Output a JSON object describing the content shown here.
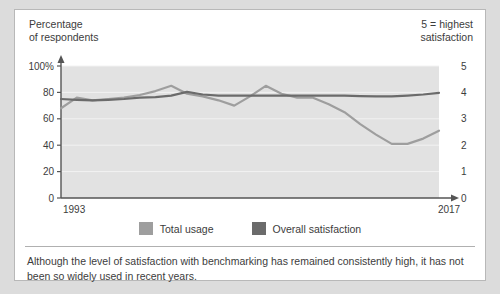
{
  "header": {
    "left_label": "Percentage\nof respondents",
    "right_label": "5 = highest\nsatisfaction"
  },
  "legend": {
    "items": [
      {
        "label": "Total usage",
        "color": "#9e9e9e"
      },
      {
        "label": "Overall satisfaction",
        "color": "#6b6b6b"
      }
    ]
  },
  "caption": {
    "text": "Although the level of satisfaction with benchmarking has remained consistently high, it has not been so widely used in recent years."
  },
  "chart_data": {
    "type": "line",
    "title": "",
    "subtitle": "",
    "xlabel": "",
    "ylabel": "Percentage of respondents",
    "y2label": "5 = highest satisfaction",
    "grid": true,
    "legend_position": "bottom",
    "plot_background": "#e2e2e2",
    "x": [
      1993,
      1994,
      1995,
      1996,
      1997,
      1998,
      1999,
      2000,
      2001,
      2002,
      2003,
      2004,
      2005,
      2006,
      2007,
      2008,
      2009,
      2010,
      2011,
      2012,
      2013,
      2014,
      2015,
      2016,
      2017
    ],
    "xlim": [
      1993,
      2017
    ],
    "x_tick_labels": [
      "1993",
      "2017"
    ],
    "ylim": [
      0,
      100
    ],
    "y_tick_labels": [
      "0",
      "20",
      "40",
      "60",
      "80",
      "100%"
    ],
    "y_ticks": [
      0,
      20,
      40,
      60,
      80,
      100
    ],
    "y2lim": [
      0,
      5
    ],
    "y2_tick_labels": [
      "0",
      "1",
      "2",
      "3",
      "4",
      "5"
    ],
    "y2_ticks": [
      0,
      1,
      2,
      3,
      4,
      5
    ],
    "series": [
      {
        "name": "Total usage",
        "color": "#9e9e9e",
        "axis": "left",
        "units": "percent",
        "values": [
          68,
          76,
          74,
          75,
          76,
          78,
          81,
          85,
          79,
          77,
          74,
          70,
          77,
          85,
          79,
          76,
          76,
          71,
          65,
          56,
          48,
          41,
          41,
          45,
          51
        ]
      },
      {
        "name": "Overall satisfaction",
        "color": "#6b6b6b",
        "axis": "right",
        "units": "rating",
        "values": [
          3.75,
          3.72,
          3.7,
          3.72,
          3.75,
          3.8,
          3.82,
          3.88,
          4.02,
          3.92,
          3.88,
          3.88,
          3.88,
          3.88,
          3.88,
          3.88,
          3.88,
          3.88,
          3.88,
          3.86,
          3.85,
          3.85,
          3.88,
          3.92,
          3.98
        ]
      }
    ]
  }
}
